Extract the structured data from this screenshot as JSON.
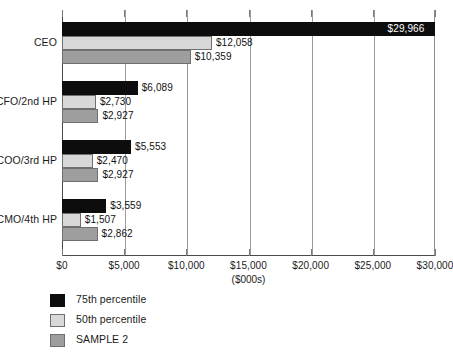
{
  "chart_data": {
    "type": "bar",
    "orientation": "horizontal",
    "title": "",
    "xlabel": "($000s)",
    "ylabel": "",
    "xlim": [
      0,
      30000
    ],
    "xticks": [
      0,
      5000,
      10000,
      15000,
      20000,
      25000,
      30000
    ],
    "xtick_labels": [
      "$0",
      "$5,000",
      "$10,000",
      "$15,000",
      "$20,000",
      "$25,000",
      "$30,000"
    ],
    "grid": true,
    "grid_axis": "x",
    "legend_position": "bottom-left",
    "categories": [
      "CEO",
      "CFO/2nd HP",
      "COO/3rd HP",
      "CMO/4th HP"
    ],
    "series": [
      {
        "name": "75th percentile",
        "color": "#0d0d0d",
        "values": [
          29966,
          6089,
          5553,
          3559
        ],
        "labels": [
          "$29,966",
          "$6,089",
          "$5,553",
          "$3,559"
        ],
        "label_placement": [
          "inside",
          "outside",
          "outside",
          "outside"
        ]
      },
      {
        "name": "50th percentile",
        "color": "#d8d8d8",
        "values": [
          12058,
          2730,
          2470,
          1507
        ],
        "labels": [
          "$12,058",
          "$2,730",
          "$2,470",
          "$1,507"
        ],
        "label_placement": [
          "outside",
          "outside",
          "outside",
          "outside"
        ]
      },
      {
        "name": "SAMPLE 2",
        "color": "#9e9e9e",
        "values": [
          10359,
          2927,
          2927,
          2862
        ],
        "labels": [
          "$10,359",
          "$2,927",
          "$2,927",
          "$2,862"
        ],
        "label_placement": [
          "outside",
          "outside",
          "outside",
          "outside"
        ]
      }
    ]
  },
  "legend": {
    "items": [
      {
        "label": "75th percentile",
        "color": "#0d0d0d"
      },
      {
        "label": "50th percentile",
        "color": "#d8d8d8"
      },
      {
        "label": "SAMPLE 2",
        "color": "#9e9e9e"
      }
    ]
  }
}
